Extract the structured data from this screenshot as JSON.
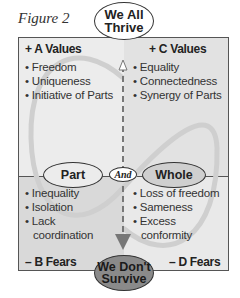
{
  "figure": {
    "title": "Figure 2",
    "top_node": {
      "line1": "We All",
      "line2": "Thrive"
    },
    "bottom_node": {
      "line1": "We Don't",
      "line2": "Survive"
    },
    "left_node": "Part",
    "right_node": "Whole",
    "connector": "And",
    "quadrants": {
      "a": {
        "heading": "+ A Values",
        "items": [
          "Freedom",
          "Uniqueness",
          "Initiative of Parts"
        ]
      },
      "c": {
        "heading": "+ C Values",
        "items": [
          "Equality",
          "Connectedness",
          "Synergy of Parts"
        ]
      },
      "b": {
        "heading": "– B Fears",
        "items": [
          "Inequality",
          "Isolation",
          "Lack",
          "coordination"
        ]
      },
      "d": {
        "heading": "– D Fears",
        "items": [
          "Loss of freedom",
          "Sameness",
          "Excess",
          "conformity"
        ]
      }
    },
    "colors": {
      "border": "#555555",
      "bottom_node_fill": "#8a8a8a",
      "arrow": "#777777"
    }
  }
}
